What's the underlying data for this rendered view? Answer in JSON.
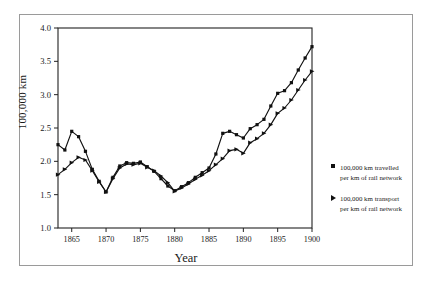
{
  "chart_data": {
    "type": "line",
    "title": "",
    "xlabel": "Year",
    "ylabel": "100,000 km",
    "xlim": [
      1863,
      1900
    ],
    "ylim": [
      1.0,
      4.0
    ],
    "grid": false,
    "legend_position": "right-outside",
    "x_ticks": [
      "1865",
      "1870",
      "1875",
      "1880",
      "1885",
      "1890",
      "1895",
      "1900"
    ],
    "x_tick_values": [
      1865,
      1870,
      1875,
      1880,
      1885,
      1890,
      1895,
      1900
    ],
    "y_ticks": [
      "1.0",
      "1.5",
      "2.0",
      "2.5",
      "3.0",
      "3.5",
      "4.0"
    ],
    "y_tick_values": [
      1.0,
      1.5,
      2.0,
      2.5,
      3.0,
      3.5,
      4.0
    ],
    "x": [
      1863,
      1864,
      1865,
      1866,
      1867,
      1868,
      1869,
      1870,
      1871,
      1872,
      1873,
      1874,
      1875,
      1876,
      1877,
      1878,
      1879,
      1880,
      1881,
      1882,
      1883,
      1884,
      1885,
      1886,
      1887,
      1888,
      1889,
      1890,
      1891,
      1892,
      1893,
      1894,
      1895,
      1896,
      1897,
      1898,
      1899,
      1900
    ],
    "series": [
      {
        "name": "100,000 km travelled per km of rail network",
        "marker": "square",
        "color": "#111111",
        "values": [
          2.25,
          2.17,
          2.45,
          2.37,
          2.15,
          1.88,
          1.7,
          1.54,
          1.76,
          1.93,
          1.98,
          1.97,
          1.99,
          1.92,
          1.85,
          1.74,
          1.63,
          1.56,
          1.62,
          1.68,
          1.76,
          1.83,
          1.9,
          2.11,
          2.42,
          2.45,
          2.4,
          2.35,
          2.49,
          2.55,
          2.63,
          2.83,
          3.02,
          3.06,
          3.18,
          3.37,
          3.55,
          3.72
        ]
      },
      {
        "name": "100,000 km transport per km of rail network",
        "marker": "triangle",
        "color": "#111111",
        "values": [
          1.8,
          1.88,
          1.98,
          2.06,
          2.02,
          1.86,
          1.69,
          1.54,
          1.74,
          1.9,
          1.96,
          1.95,
          1.97,
          1.91,
          1.86,
          1.78,
          1.68,
          1.55,
          1.6,
          1.66,
          1.73,
          1.79,
          1.86,
          1.95,
          2.04,
          2.16,
          2.18,
          2.12,
          2.28,
          2.34,
          2.42,
          2.55,
          2.72,
          2.8,
          2.92,
          3.07,
          3.22,
          3.35
        ]
      }
    ]
  },
  "legend": {
    "entries": [
      {
        "marker": "square-marker",
        "label": "100,000 km travelled\nper km of rail network"
      },
      {
        "marker": "triangle-marker",
        "label": "100,000 km transport\nper km of rail network"
      }
    ]
  },
  "axis": {
    "y_title": "100,000 km",
    "x_title": "Year"
  }
}
